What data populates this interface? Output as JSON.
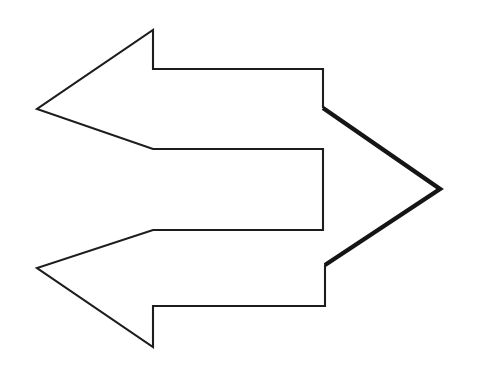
{
  "canvas": {
    "width": 484,
    "height": 387,
    "background_color": "#ffffff",
    "title": "Double-headed arrow outline figure"
  },
  "figure": {
    "name": "double-arrow-outline",
    "description": "Outlined two-headed arrow: a large left-pointing double-barbed arrow on the left joined to a right-pointing arrowhead on the right, drawn as a single closed polygon with a white fill and dark outline.",
    "fill_color": "#ffffff",
    "thin_stroke_color": "#1d1d1d",
    "thin_stroke_width": 2.1,
    "thick_stroke_color": "#151515",
    "thick_stroke_width": 4.4,
    "outline_points": [
      [
        153,
        30
      ],
      [
        153,
        69
      ],
      [
        323,
        69
      ],
      [
        323,
        108
      ],
      [
        440,
        189
      ],
      [
        325,
        265
      ],
      [
        325,
        306
      ],
      [
        153,
        306
      ],
      [
        153,
        347
      ],
      [
        37,
        268
      ],
      [
        153,
        230
      ],
      [
        323,
        230
      ],
      [
        323,
        149
      ],
      [
        153,
        149
      ],
      [
        37,
        109
      ]
    ],
    "thin_path": "M 440 189 L 325 265 L 325 306 L 153 306 L 153 347 L 37 268 L 153 230 L 323 230 L 323 149 L 153 149 L 37 109 L 153 30 L 153 69 L 323 69 L 323 108",
    "thick_path": "M 323 108 L 440 189 L 325 265",
    "vertex_labels": [
      "top-apex",
      "top-shaft-top-left",
      "top-shaft-top-right",
      "upper-diagonal-start",
      "right-tip",
      "lower-diagonal-end",
      "bottom-shaft-bottom-right",
      "bottom-shaft-bottom-left",
      "bottom-apex",
      "left-lower-point",
      "notch-lower-left",
      "notch-lower-right",
      "notch-upper-right",
      "notch-upper-left",
      "left-upper-point"
    ]
  }
}
